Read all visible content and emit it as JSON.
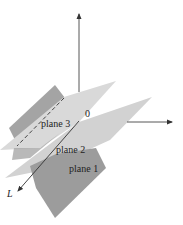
{
  "diagram": {
    "type": "three-planes-intersecting-in-a-line",
    "axes": {
      "vertical": {
        "label": ""
      },
      "horizontal": {
        "label": ""
      },
      "origin_label": "0"
    },
    "line": {
      "label": "L"
    },
    "planes": [
      {
        "id": "plane1",
        "label": "plane 1",
        "color": "#9a9a9a"
      },
      {
        "id": "plane2",
        "label": "plane 2",
        "color": "#d4d4d4"
      },
      {
        "id": "plane3",
        "label": "plane 3",
        "color": "#cfcfcf"
      }
    ],
    "colors": {
      "dark_plane": "#9a9a9a",
      "light_plane": "#d6d6d6",
      "axis": "#333333",
      "background": "#ffffff"
    }
  }
}
